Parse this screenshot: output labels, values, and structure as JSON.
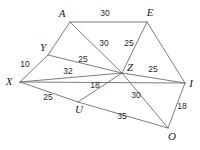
{
  "figure": {
    "type": "geometry-diagram",
    "background_color": "#ffffff",
    "line_color": "#6e6e6e",
    "label_color": "#1a1a1a",
    "vertices": [
      {
        "name": "A",
        "label": "A",
        "x": 70,
        "y": 22,
        "label_x": 62,
        "label_y": 14
      },
      {
        "name": "E",
        "label": "E",
        "x": 147,
        "y": 22,
        "label_x": 150,
        "label_y": 13
      },
      {
        "name": "Y",
        "label": "Y",
        "x": 48,
        "y": 55,
        "label_x": 43,
        "label_y": 48
      },
      {
        "name": "Z",
        "label": "Z",
        "x": 122,
        "y": 73,
        "label_x": 130,
        "label_y": 68
      },
      {
        "name": "X",
        "label": "X",
        "x": 20,
        "y": 82,
        "label_x": 9,
        "label_y": 82
      },
      {
        "name": "I",
        "label": "I",
        "x": 185,
        "y": 83,
        "label_x": 191,
        "label_y": 84
      },
      {
        "name": "U",
        "label": "U",
        "x": 78,
        "y": 102,
        "label_x": 79,
        "label_y": 110
      },
      {
        "name": "O",
        "label": "O",
        "x": 168,
        "y": 128,
        "label_x": 172,
        "label_y": 137
      }
    ],
    "edges": [
      {
        "name": "A-E",
        "from": "A",
        "to": "E",
        "length": "30",
        "label_x": 105,
        "label_y": 14
      },
      {
        "name": "A-Y",
        "from": "A",
        "to": "Y",
        "length": "",
        "label_x": 0,
        "label_y": 0
      },
      {
        "name": "A-Z",
        "from": "A",
        "to": "Z",
        "length": "30",
        "label_x": 104,
        "label_y": 44
      },
      {
        "name": "E-Z",
        "from": "E",
        "to": "Z",
        "length": "25",
        "label_x": 129,
        "label_y": 44
      },
      {
        "name": "E-I",
        "from": "E",
        "to": "I",
        "length": "",
        "label_x": 0,
        "label_y": 0
      },
      {
        "name": "Y-Z",
        "from": "Y",
        "to": "Z",
        "length": "25",
        "label_x": 83,
        "label_y": 60
      },
      {
        "name": "X-Y",
        "from": "X",
        "to": "Y",
        "length": "10",
        "label_x": 25,
        "label_y": 65
      },
      {
        "name": "X-Z",
        "from": "X",
        "to": "Z",
        "length": "32",
        "label_x": 68,
        "label_y": 72
      },
      {
        "name": "Z-I",
        "from": "Z",
        "to": "I",
        "length": "25",
        "label_x": 153,
        "label_y": 70
      },
      {
        "name": "X-U",
        "from": "X",
        "to": "U",
        "length": "25",
        "label_x": 48,
        "label_y": 98
      },
      {
        "name": "U-Z",
        "from": "U",
        "to": "Z",
        "length": "18",
        "label_x": 95,
        "label_y": 86
      },
      {
        "name": "Z-O",
        "from": "Z",
        "to": "O",
        "length": "30",
        "label_x": 136,
        "label_y": 96
      },
      {
        "name": "U-O",
        "from": "U",
        "to": "O",
        "length": "35",
        "label_x": 122,
        "label_y": 117
      },
      {
        "name": "I-O",
        "from": "I",
        "to": "O",
        "length": "18",
        "label_x": 182,
        "label_y": 107
      },
      {
        "name": "X-I",
        "from": "X",
        "to": "I",
        "length": "",
        "label_x": 0,
        "label_y": 0
      }
    ]
  }
}
